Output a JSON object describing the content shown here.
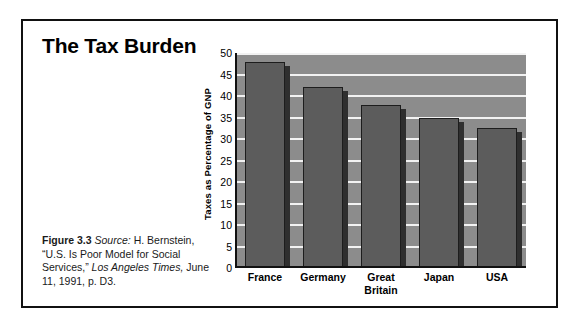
{
  "figure": {
    "title": "The Tax Burden",
    "caption": {
      "figure_number": "Figure 3.3",
      "source_label": "Source:",
      "source_author": "H. Bernstein,",
      "article_title": "“U.S. Is Poor Model for Social Services,”",
      "publication": "Los Angeles Times,",
      "date_page": "June 11, 1991, p. D3."
    },
    "colors": {
      "frame_border": "#111111",
      "plot_background": "#8c8c8c",
      "bar_fill": "#5c5c5c",
      "bar_outline": "#1d1d1d",
      "bar_shadow": "#2f2f2f",
      "gridline": "#f2f2f2",
      "text": "#000000"
    }
  },
  "chart_data": {
    "type": "bar",
    "title": "The Tax Burden",
    "categories": [
      "France",
      "Germany",
      "Great Britain",
      "Japan",
      "USA"
    ],
    "category_lines": [
      [
        "France"
      ],
      [
        "Germany"
      ],
      [
        "Great",
        "Britain"
      ],
      [
        "Japan"
      ],
      [
        "USA"
      ]
    ],
    "values": [
      48,
      42,
      38,
      35,
      32.5
    ],
    "xlabel": "",
    "ylabel": "Taxes as Percentage of GNP",
    "ylim": [
      0,
      50
    ],
    "ytick_values": [
      0,
      5,
      10,
      15,
      20,
      25,
      30,
      35,
      40,
      45,
      50
    ],
    "ytick_labels": [
      "0",
      "5",
      "10",
      "15",
      "20",
      "25",
      "30",
      "35",
      "40",
      "45",
      "50"
    ],
    "gridlines": true,
    "gridline_values": [
      5,
      10,
      15,
      20,
      25,
      30,
      35,
      40,
      45,
      50
    ],
    "legend": null,
    "legend_position": "none"
  }
}
